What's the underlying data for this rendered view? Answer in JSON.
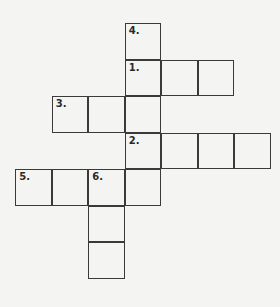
{
  "crossword": {
    "origin": {
      "x": 16,
      "y": 24
    },
    "cell_size": 36.5,
    "cells": [
      {
        "row": 0,
        "col": 3,
        "number": "4."
      },
      {
        "row": 1,
        "col": 3,
        "number": "1."
      },
      {
        "row": 1,
        "col": 4,
        "number": ""
      },
      {
        "row": 1,
        "col": 5,
        "number": ""
      },
      {
        "row": 2,
        "col": 1,
        "number": "3."
      },
      {
        "row": 2,
        "col": 2,
        "number": ""
      },
      {
        "row": 2,
        "col": 3,
        "number": ""
      },
      {
        "row": 3,
        "col": 3,
        "number": "2."
      },
      {
        "row": 3,
        "col": 4,
        "number": ""
      },
      {
        "row": 3,
        "col": 5,
        "number": ""
      },
      {
        "row": 3,
        "col": 6,
        "number": ""
      },
      {
        "row": 4,
        "col": 0,
        "number": "5."
      },
      {
        "row": 4,
        "col": 1,
        "number": ""
      },
      {
        "row": 4,
        "col": 2,
        "number": "6."
      },
      {
        "row": 4,
        "col": 3,
        "number": ""
      },
      {
        "row": 5,
        "col": 2,
        "number": ""
      },
      {
        "row": 6,
        "col": 2,
        "number": ""
      }
    ]
  }
}
